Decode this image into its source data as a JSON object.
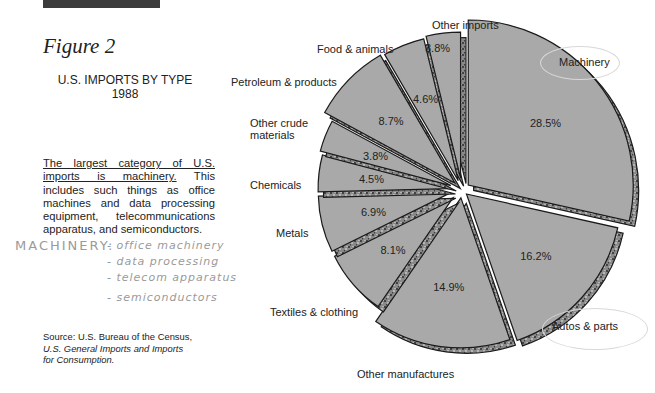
{
  "header": {
    "figure_label": "Figure 2",
    "title_line1": "U.S. IMPORTS BY TYPE",
    "title_line2": "1988"
  },
  "description": {
    "underlined": "The largest category of U.S. imports is machinery.",
    "rest": " This includes such things as office machines and data processing equipment, telecommunications apparatus, and semiconductors."
  },
  "handwritten_note": {
    "heading": "MACHINERY:",
    "items": [
      "- office machinery",
      "- data processing",
      "- telecom apparatus",
      "- semiconductors"
    ]
  },
  "source": {
    "line1": "Source: U.S. Bureau of the Census,",
    "line2": "U.S. General Imports and Imports",
    "line3": "for Consumption."
  },
  "colors": {
    "slice_fill": "#a9a9a9",
    "slice_edge": "#1a1a1a",
    "side_fill": "#7d7d7d",
    "header_bar": "#3c3c3c",
    "handwriting": "#9a9a9a"
  },
  "chart_data": {
    "type": "pie",
    "title": "U.S. IMPORTS BY TYPE 1988",
    "style": "exploded 3D pie",
    "categories": [
      "Machinery",
      "Autos & parts",
      "Other manufactures",
      "Textiles & clothing",
      "Metals",
      "Chemicals",
      "Other crude materials",
      "Petroleum & products",
      "Food & animals",
      "Other imports"
    ],
    "values": [
      28.5,
      16.2,
      14.9,
      8.1,
      6.9,
      4.5,
      3.8,
      8.7,
      4.6,
      3.8
    ],
    "value_labels": [
      "28.5%",
      "16.2%",
      "14.9%",
      "8.1%",
      "6.9%",
      "4.5%",
      "3.8%",
      "8.7%",
      "4.6%",
      "3.8%"
    ],
    "unit": "%",
    "annotations": [
      "Machinery (circled)",
      "Autos & parts (circled)"
    ]
  },
  "slice_labels": {
    "machinery": "Machinery",
    "autos": "Autos & parts",
    "other_manufactures": "Other manufactures",
    "textiles": "Textiles & clothing",
    "metals": "Metals",
    "chemicals": "Chemicals",
    "crude_1": "Other crude",
    "crude_2": "materials",
    "petroleum": "Petroleum & products",
    "food": "Food & animals",
    "other_imports": "Other imports",
    "other_imports_pct": "3.8%"
  }
}
